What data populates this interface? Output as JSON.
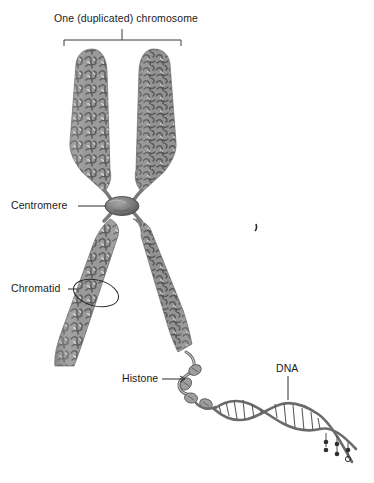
{
  "figure": {
    "title_label": "One (duplicated) chromosome",
    "background_color": "#ffffff",
    "ink_color": "#1a1a1a",
    "chromatin_color": "#8d8d8d",
    "chromatin_shadow_color": "#5f5f5f",
    "centromere_color": "#6e6e6e",
    "width": 374,
    "height": 483
  },
  "labels": {
    "chromosome": "One (duplicated) chromosome",
    "centromere": "Centromere",
    "chromatid": "Chromatid",
    "histone": "Histone",
    "dna": "DNA"
  },
  "parts": [
    {
      "name": "upper-left-chromatid-arm",
      "label": "",
      "description": "upper left sister chromatid arm"
    },
    {
      "name": "upper-right-chromatid-arm",
      "label": "",
      "description": "upper right sister chromatid arm"
    },
    {
      "name": "lower-left-chromatid-arm",
      "label": "Chromatid",
      "description": "lower left sister chromatid arm, circled by callout"
    },
    {
      "name": "lower-right-chromatid-arm",
      "label": "",
      "description": "lower right sister chromatid arm unraveling into chromatin fiber"
    },
    {
      "name": "centromere",
      "label": "Centromere",
      "description": "constricted dark ellipse joining the four arms"
    },
    {
      "name": "nucleosome-fiber",
      "label": "Histone",
      "description": "beads-on-a-string chromatin fiber with histone proteins"
    },
    {
      "name": "dna-double-helix",
      "label": "DNA",
      "description": "DNA double helix with base pair rungs, unwinding at lower right"
    }
  ]
}
